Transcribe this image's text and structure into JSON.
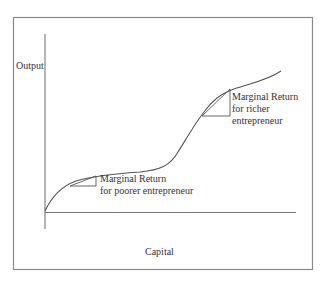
{
  "diagram": {
    "type": "production-function",
    "y_axis_label": "Output",
    "x_axis_label": "Capital",
    "annotations": {
      "poorer": {
        "line1": "Marginal Return",
        "line2": "for poorer entrepreneur"
      },
      "richer": {
        "line1": "Marginal Return",
        "line2": "for richer",
        "line3": "entrepreneur"
      }
    },
    "colors": {
      "frame": "#8a8a8a",
      "axis": "#777777",
      "curve": "#555555",
      "text": "#333333"
    }
  }
}
